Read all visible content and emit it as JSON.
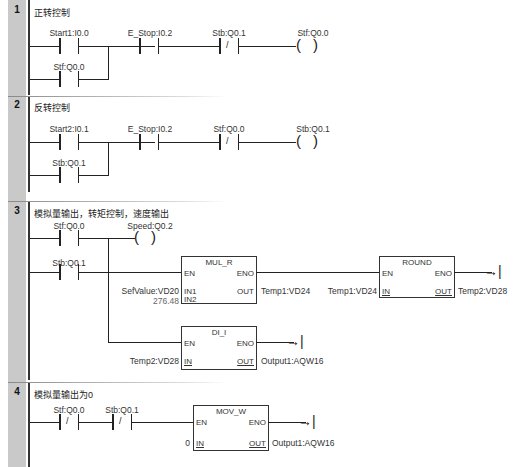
{
  "networks": [
    {
      "number": "1",
      "title": "正转控制",
      "contacts": [
        {
          "label": "Start1:I0.0",
          "type": "NO"
        },
        {
          "label": "Stf:Q0.0",
          "type": "NO"
        },
        {
          "label": "E_Stop:I0.2",
          "type": "NO"
        },
        {
          "label": "Stb:Q0.1",
          "type": "NC"
        }
      ],
      "coil": {
        "label": "Stf:Q0.0"
      }
    },
    {
      "number": "2",
      "title": "反转控制",
      "contacts": [
        {
          "label": "Start2:I0.1",
          "type": "NO"
        },
        {
          "label": "Stb:Q0.1",
          "type": "NO"
        },
        {
          "label": "E_Stop:I0.2",
          "type": "NO"
        },
        {
          "label": "Stf:Q0.0",
          "type": "NC"
        }
      ],
      "coil": {
        "label": "Stb:Q0.1"
      }
    },
    {
      "number": "3",
      "title": "模拟量输出，转矩控制，速度输出",
      "contacts": [
        {
          "label": "Stf:Q0.0",
          "type": "NO"
        },
        {
          "label": "Stb:Q0.1",
          "type": "NO"
        }
      ],
      "coil": {
        "label": "Speed:Q0.2"
      },
      "boxes": [
        {
          "name": "MUL_R",
          "en": "EN",
          "eno": "ENO",
          "in1": "IN1",
          "in2": "IN2",
          "out": "OUT",
          "in1_val": "SefValue:VD20",
          "in2_val": "276.48",
          "out_val": "Temp1:VD24"
        },
        {
          "name": "ROUND",
          "en": "EN",
          "eno": "ENO",
          "in": "IN",
          "out": "OUT",
          "in_val": "Temp1:VD24",
          "out_val": "Temp2:VD28"
        },
        {
          "name": "DI_I",
          "en": "EN",
          "eno": "ENO",
          "in": "IN",
          "out": "OUT",
          "in_val": "Temp2:VD28",
          "out_val": "Output1:AQW16"
        }
      ]
    },
    {
      "number": "4",
      "title": "模拟量输出为0",
      "contacts": [
        {
          "label": "Stf:Q0.0",
          "type": "NC"
        },
        {
          "label": "Stb:Q0.1",
          "type": "NC"
        }
      ],
      "boxes": [
        {
          "name": "MOV_W",
          "en": "EN",
          "eno": "ENO",
          "in": "IN",
          "out": "OUT",
          "in_val": "0",
          "out_val": "Output1:AQW16"
        }
      ]
    }
  ],
  "symbols": {
    "nc_slash": "/",
    "coil_left": "(",
    "coil_right": ")",
    "eno_arrow": "→|"
  }
}
